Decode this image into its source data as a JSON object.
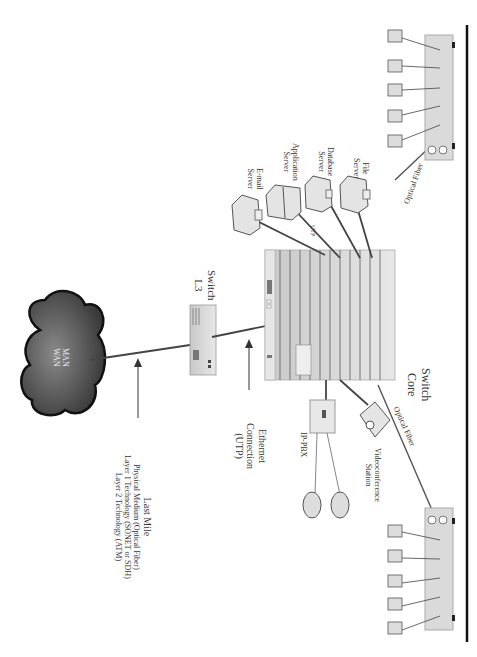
{
  "diagram": {
    "orientation": "rotated 90 degrees clockwise",
    "cloud": {
      "line1": "MAN",
      "line2": "WAN"
    },
    "last_mile": {
      "title": "Last Mile",
      "line1": "Physical Medium (Optical Fiber)",
      "line2": "Layer 1 Technology (SONET or SDH)",
      "line3": "Layer 2 Technology (ATM)"
    },
    "switch_l3": {
      "line1": "Switch",
      "line2": "L3"
    },
    "switch_core": {
      "line1": "Switch",
      "line2": "Core"
    },
    "ethernet": {
      "line1": "Ethernet",
      "line2": "Connection",
      "line3": "(UTP)"
    },
    "servers": [
      {
        "line1": "E-mail",
        "line2": "Server"
      },
      {
        "line1": "Application",
        "line2": "Server"
      },
      {
        "line1": "Database",
        "line2": "Server"
      },
      {
        "line1": "File",
        "line2": "Server"
      }
    ],
    "utp_label": "UTP",
    "ip_pbx": "IP-PBX",
    "videoconference": {
      "line1": "Videoconference",
      "line2": "Station"
    },
    "optical_fiber_top": "Optical Fiber",
    "optical_fiber_bottom": "Optical Fiber",
    "access_switches": [
      {
        "position": "top",
        "workstations": 5
      },
      {
        "position": "bottom",
        "workstations": 5
      }
    ],
    "phones": 2,
    "colors": {
      "cloud": "#555555",
      "cloud_edge": "#111111",
      "switch": "#d6d6d6",
      "link": "#444444",
      "rule": "#111111"
    }
  }
}
